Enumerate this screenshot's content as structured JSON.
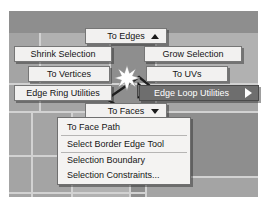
{
  "app": {
    "context": "maya-marking-menu",
    "viewport_background_color": "#b9b9b9",
    "highlight_color": "#6e6e6e",
    "menu_background_color": "#f2f1f0"
  },
  "marking_menu": {
    "north": {
      "label": "To Edges",
      "icon": "triangle-up-icon"
    },
    "west": {
      "label": "Shrink Selection"
    },
    "east": {
      "label": "Grow Selection"
    },
    "northwest": {
      "label": "To Vertices"
    },
    "northeast": {
      "label": "To UVs"
    },
    "southwest": {
      "label": "Edge Ring Utilities"
    },
    "southeast": {
      "label": "Edge Loop Utilities",
      "icon": "triangle-right-icon",
      "highlighted": true
    },
    "south": {
      "label": "To Faces",
      "icon": "triangle-down-icon"
    }
  },
  "submenu": {
    "title": "Edge Loop Utilities",
    "items": [
      {
        "label": "To Face Path"
      },
      {
        "label": "Select Border Edge Tool"
      },
      {
        "label": "Selection Boundary"
      },
      {
        "label": "Selection Constraints..."
      }
    ]
  },
  "viewport": {
    "selection_marker": "star-burst-icon",
    "pointer": "mouse-cursor-icon"
  }
}
